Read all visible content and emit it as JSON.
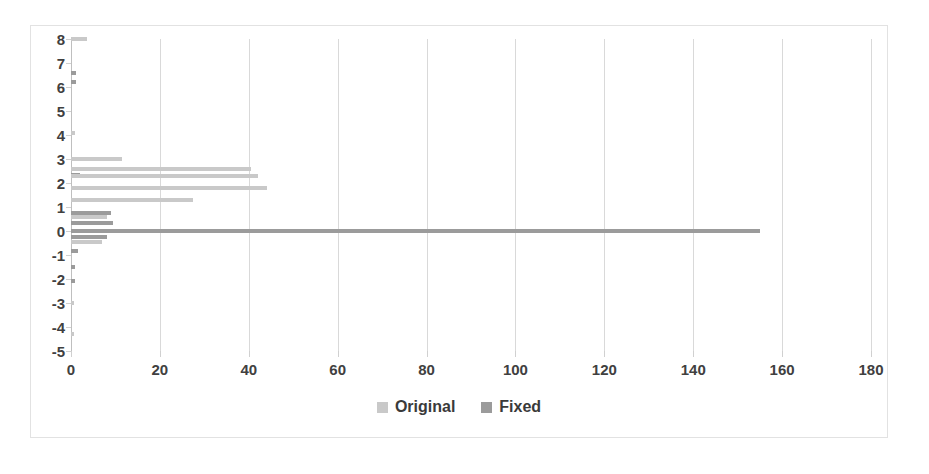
{
  "chart_data": {
    "type": "bar",
    "orientation": "horizontal",
    "title": "",
    "xlabel": "",
    "ylabel": "",
    "xlim": [
      0,
      180
    ],
    "ylim": [
      -5,
      8
    ],
    "xticks": [
      0,
      20,
      40,
      60,
      80,
      100,
      120,
      140,
      160,
      180
    ],
    "yticks": [
      8,
      7,
      6,
      5,
      4,
      3,
      2,
      1,
      0,
      -1,
      -2,
      -3,
      -4,
      -5
    ],
    "grid": "vertical",
    "legend_position": "bottom",
    "categories": [
      8,
      7,
      6,
      5,
      4,
      3,
      2,
      1,
      0,
      -1,
      -2,
      -3,
      -4,
      -5
    ],
    "series": [
      {
        "name": "Original",
        "color": "#c9c9c9",
        "values": [
          3.5,
          0,
          1.2,
          0,
          0.9,
          11.5,
          40.5,
          42.0,
          4.5,
          1.5,
          0,
          0,
          0,
          0.5
        ]
      },
      {
        "name": "Fixed",
        "color": "#9b9b9b",
        "values": [
          0,
          0.8,
          0,
          0,
          0,
          0.8,
          2.0,
          44.0,
          155.0,
          7.0,
          0.8,
          0,
          0,
          0
        ]
      }
    ],
    "points": [
      {
        "y": 8.0,
        "series": "Original",
        "value": 3.5
      },
      {
        "y": 6.6,
        "series": "Fixed",
        "value": 1.2
      },
      {
        "y": 6.2,
        "series": "Fixed",
        "value": 1.1
      },
      {
        "y": 4.1,
        "series": "Original",
        "value": 0.9
      },
      {
        "y": 3.0,
        "series": "Original",
        "value": 11.5
      },
      {
        "y": 2.6,
        "series": "Original",
        "value": 40.5
      },
      {
        "y": 2.35,
        "series": "Fixed",
        "value": 2.0
      },
      {
        "y": 2.3,
        "series": "Original",
        "value": 42.0
      },
      {
        "y": 1.8,
        "series": "Original",
        "value": 44.0
      },
      {
        "y": 1.3,
        "series": "Original",
        "value": 27.5
      },
      {
        "y": 0.75,
        "series": "Fixed",
        "value": 9.0
      },
      {
        "y": 0.6,
        "series": "Original",
        "value": 8.0
      },
      {
        "y": 0.35,
        "series": "Fixed",
        "value": 9.5
      },
      {
        "y": 0.0,
        "series": "Fixed",
        "value": 155.0
      },
      {
        "y": -0.25,
        "series": "Fixed",
        "value": 8.0
      },
      {
        "y": -0.45,
        "series": "Original",
        "value": 7.0
      },
      {
        "y": -0.85,
        "series": "Fixed",
        "value": 1.5
      },
      {
        "y": -1.5,
        "series": "Fixed",
        "value": 0.9
      },
      {
        "y": -2.1,
        "series": "Fixed",
        "value": 0.9
      },
      {
        "y": -3.0,
        "series": "Original",
        "value": 0.6
      },
      {
        "y": -4.3,
        "series": "Original",
        "value": 0.6
      }
    ]
  },
  "legend": {
    "items": [
      {
        "label": "Original",
        "swatch": "original"
      },
      {
        "label": "Fixed",
        "swatch": "fixed"
      }
    ]
  },
  "axis": {
    "x_tick_labels": [
      "0",
      "20",
      "40",
      "60",
      "80",
      "100",
      "120",
      "140",
      "160",
      "180"
    ],
    "y_tick_labels": [
      "8",
      "7",
      "6",
      "5",
      "4",
      "3",
      "2",
      "1",
      "0",
      "-1",
      "-2",
      "-3",
      "-4",
      "-5"
    ]
  }
}
